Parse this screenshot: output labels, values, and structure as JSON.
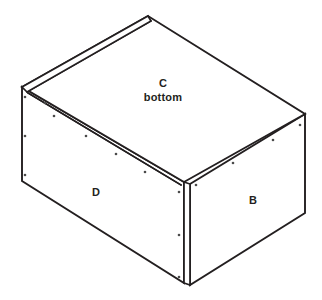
{
  "diagram": {
    "background_color": "#ffffff",
    "line_color": "#231f20",
    "labels": {
      "top_panel": "C",
      "top_panel_sub": "bottom",
      "left_panel": "D",
      "right_panel": "B"
    }
  },
  "geometry": {
    "top_apex": "148,16",
    "left_apex": "22,87",
    "right_corner": "305,114",
    "front_top_corner": "184,182",
    "bottom_left": "22,181",
    "bottom_right": "305,213",
    "front_bottom": "185,283",
    "board_thickness_px": "5"
  }
}
